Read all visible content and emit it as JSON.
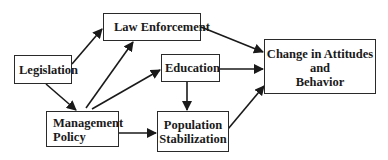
{
  "diagram": {
    "nodes": {
      "legislation": {
        "label": "Legislation"
      },
      "law_enforcement": {
        "label": "Law Enforcement"
      },
      "education": {
        "label": "Education"
      },
      "management_policy": {
        "line1": "Management",
        "line2": "Policy"
      },
      "population_stabilization": {
        "line1": "Population",
        "line2": "Stabilization"
      },
      "change": {
        "line1": "Change in Attitudes",
        "line2": "and",
        "line3": "Behavior"
      }
    },
    "edges": [
      {
        "from": "Legislation",
        "to": "Law Enforcement"
      },
      {
        "from": "Legislation",
        "to": "Management Policy"
      },
      {
        "from": "Management Policy",
        "to": "Law Enforcement"
      },
      {
        "from": "Management Policy",
        "to": "Education"
      },
      {
        "from": "Management Policy",
        "to": "Population Stabilization"
      },
      {
        "from": "Education",
        "to": "Population Stabilization"
      },
      {
        "from": "Law Enforcement",
        "to": "Change in Attitudes and Behavior"
      },
      {
        "from": "Education",
        "to": "Change in Attitudes and Behavior"
      },
      {
        "from": "Population Stabilization",
        "to": "Change in Attitudes and Behavior"
      }
    ],
    "colors": {
      "line": "#1a1a1a",
      "background": "#ffffff"
    }
  }
}
